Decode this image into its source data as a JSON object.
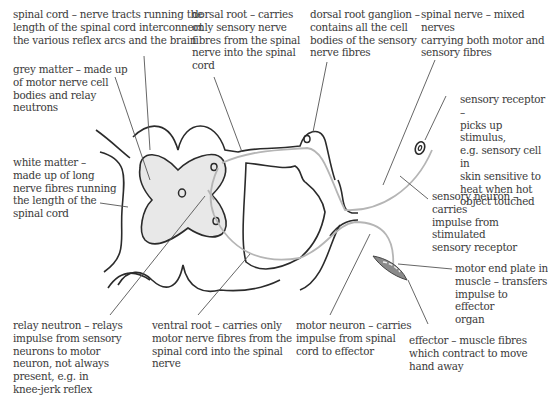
{
  "diagram": {
    "type": "reflex-arc",
    "labels": {
      "spinal_cord": "spinal cord – nerve tracts running the\nlength of the spinal cord interconnect\nthe various reflex arcs and the brain",
      "dorsal_root": "dorsal root – carries\nonly sensory nerve\nfibres from the spinal\nnerve into the spinal\ncord",
      "dorsal_root_ganglion": "dorsal root ganglion –\ncontains all the cell\nbodies of the sensory\nnerve fibres",
      "spinal_nerve": "spinal nerve – mixed nerves\ncarrying both motor and\nsensory fibres",
      "grey_matter": "grey matter – made up\nof motor nerve cell\nbodies and relay\nneutrons",
      "sensory_receptor": "sensory receptor –\npicks up stimulus,\ne.g. sensory cell in\nskin sensitive to\nheat when hot\nobject touched",
      "white_matter": "white matter –\nmade up of long\nnerve fibres running\nthe length of the\nspinal cord",
      "sensory_neuron": "sensory neuron – carries\nimpulse from stimulated\nsensory receptor",
      "motor_end_plate": "motor end plate in\nmuscle – transfers\nimpulse to effector\norgan",
      "relay_neutron": "relay neutron – relays\nimpulse from sensory\nneurons to motor\nneuron, not always\npresent, e.g. in\nknee-jerk reflex",
      "ventral_root": "ventral root – carries only\nmotor nerve fibres from the\nspinal cord into the spinal\nnerve",
      "motor_neuron": "motor neuron – carries\nimpulse from spinal\ncord to effector",
      "effector": "effector – muscle fibres\nwhich contract to move\nhand away"
    },
    "colors": {
      "outline": "#2b2b2b",
      "grey_matter_fill": "#e8e8e8",
      "neuron_path": "#b5b5b5",
      "leader_line": "#555555",
      "muscle_fill": "#8a8a8a",
      "text": "#3a3a3a"
    }
  }
}
